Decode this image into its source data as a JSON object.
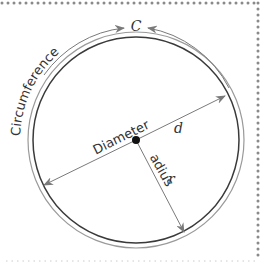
{
  "diagram": {
    "labels": {
      "circumference": "Circumference",
      "circumference_symbol": "C",
      "diameter": "Diameter",
      "diameter_symbol": "d",
      "radius": "Radius",
      "radius_symbol": "r"
    },
    "colors": {
      "circle_stroke": "#3a3a3a",
      "arrow_stroke": "#7a7a7a",
      "border_dots": "#8a8a8a",
      "center_dot": "#111111",
      "text": "#333333"
    },
    "geometry": {
      "center": [
        136,
        140
      ],
      "inner_radius": 103,
      "outer_radius": 108
    }
  }
}
